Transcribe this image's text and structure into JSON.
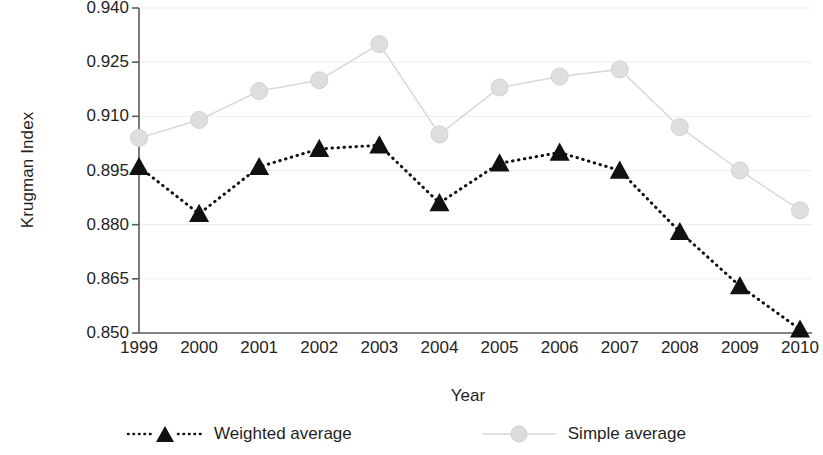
{
  "chart_data": {
    "type": "line",
    "title": "",
    "xlabel": "Year",
    "ylabel": "Krugman Index",
    "categories": [
      "1999",
      "2000",
      "2001",
      "2002",
      "2003",
      "2004",
      "2005",
      "2006",
      "2007",
      "2008",
      "2009",
      "2010"
    ],
    "x": [
      1999,
      2000,
      2001,
      2002,
      2003,
      2004,
      2005,
      2006,
      2007,
      2008,
      2009,
      2010
    ],
    "series": [
      {
        "name": "Weighted average",
        "marker": "triangle",
        "line_style": "dotted",
        "color": "#111111",
        "values": [
          0.896,
          0.883,
          0.896,
          0.901,
          0.902,
          0.886,
          0.897,
          0.9,
          0.895,
          0.878,
          0.863,
          0.851
        ]
      },
      {
        "name": "Simple average",
        "marker": "circle",
        "line_style": "solid",
        "color": "#d2d2d2",
        "values": [
          0.904,
          0.909,
          0.917,
          0.92,
          0.93,
          0.905,
          0.918,
          0.921,
          0.923,
          0.907,
          0.895,
          0.884
        ]
      }
    ],
    "ylim": [
      0.85,
      0.94
    ],
    "yticks": [
      0.85,
      0.865,
      0.88,
      0.895,
      0.91,
      0.925,
      0.94
    ],
    "ytick_labels": [
      "0.850",
      "0.865",
      "0.880",
      "0.895",
      "0.910",
      "0.925",
      "0.940"
    ],
    "xlim": [
      1999,
      2010
    ],
    "grid": "horizontal",
    "legend_position": "bottom"
  },
  "legend": {
    "items": [
      {
        "label": "Weighted average"
      },
      {
        "label": "Simple average"
      }
    ]
  },
  "axis": {
    "y_title": "Krugman Index",
    "x_title": "Year"
  }
}
